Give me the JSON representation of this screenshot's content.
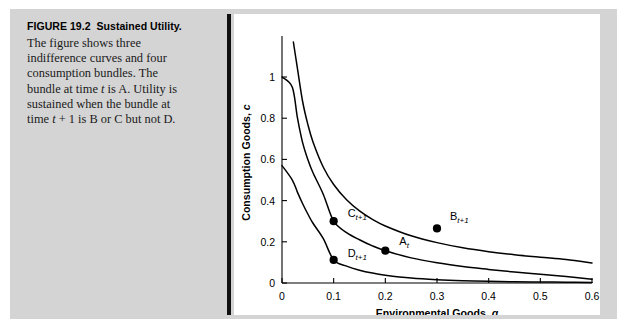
{
  "figure": {
    "label": "FIGURE 19.2",
    "title": "Sustained Utility.",
    "caption_lines": [
      "The figure shows three",
      "indifference curves and four",
      "consumption bundles. The",
      "bundle at time t is A. Utility is",
      "sustained when the bundle at",
      "time t + 1 is B or C but not D."
    ],
    "caption_full": "The figure shows three indifference curves and four consumption bundles. The bundle at time t is A. Utility is sustained when the bundle at time t + 1 is B or C but not D."
  },
  "colors": {
    "plate_background": "#d4d4d4",
    "panel_background": "#ffffff",
    "ink": "#000000",
    "divider": "#111111"
  },
  "chart_data": {
    "type": "line",
    "title": "",
    "xlabel": "Environmental Goods, g",
    "ylabel": "Consumption Goods, c",
    "xlim": [
      0,
      0.6
    ],
    "ylim": [
      0,
      1.17
    ],
    "grid": false,
    "legend": "none",
    "xticks": [
      0,
      0.1,
      0.2,
      0.3,
      0.4,
      0.5,
      0.6
    ],
    "xtick_labels": [
      "0",
      "0.1",
      "0.2",
      "0.3",
      "0.4",
      "0.5",
      "0.6"
    ],
    "yticks": [
      0,
      0.2,
      0.4,
      0.6,
      0.8,
      1
    ],
    "ytick_labels": [
      "0",
      "0.2",
      "0.4",
      "0.6",
      "0.8",
      "1"
    ],
    "series": [
      {
        "name": "upper indifference curve",
        "note": "highest utility; passes through B",
        "constant_k": 0.0795,
        "x": [
          0.022,
          0.03,
          0.04,
          0.05,
          0.06,
          0.08,
          0.1,
          0.125,
          0.15,
          0.175,
          0.2,
          0.25,
          0.3,
          0.35,
          0.4,
          0.45,
          0.5,
          0.55,
          0.6
        ],
        "y": [
          1.17,
          1.04,
          0.88,
          0.77,
          0.685,
          0.562,
          0.478,
          0.404,
          0.35,
          0.309,
          0.277,
          0.229,
          0.196,
          0.171,
          0.152,
          0.137,
          0.125,
          0.114,
          0.097
        ]
      },
      {
        "name": "middle indifference curve",
        "note": "passes through A and C",
        "constant_k": 0.0445,
        "x": [
          0.0,
          0.02,
          0.03,
          0.04,
          0.05,
          0.06,
          0.08,
          0.1,
          0.125,
          0.15,
          0.175,
          0.2,
          0.25,
          0.3,
          0.35,
          0.4,
          0.45,
          0.5,
          0.55,
          0.6
        ],
        "y": [
          1.0,
          0.95,
          0.8,
          0.68,
          0.6,
          0.535,
          0.43,
          0.3,
          0.245,
          0.21,
          0.18,
          0.157,
          0.122,
          0.098,
          0.08,
          0.066,
          0.053,
          0.042,
          0.031,
          0.018
        ]
      },
      {
        "name": "lower indifference curve",
        "note": "lowest utility; passes through D",
        "constant_k": 0.0168,
        "x": [
          0.0,
          0.02,
          0.03,
          0.04,
          0.05,
          0.06,
          0.08,
          0.1,
          0.125,
          0.15,
          0.175,
          0.2,
          0.25,
          0.3,
          0.35,
          0.4,
          0.45,
          0.5,
          0.55,
          0.6
        ],
        "y": [
          0.57,
          0.5,
          0.44,
          0.385,
          0.335,
          0.29,
          0.215,
          0.112,
          0.082,
          0.062,
          0.048,
          0.038,
          0.024,
          0.016,
          0.011,
          0.008,
          0.006,
          0.005,
          0.004,
          0.003
        ]
      }
    ],
    "points": [
      {
        "id": "C",
        "label_base": "C",
        "label_sub": "t+1",
        "x": 0.1,
        "y": 0.3,
        "label_dx": 14,
        "label_dy": -4
      },
      {
        "id": "A",
        "label_base": "A",
        "label_sub": "t",
        "x": 0.2,
        "y": 0.157,
        "label_dx": 14,
        "label_dy": -6
      },
      {
        "id": "B",
        "label_base": "B",
        "label_sub": "t+1",
        "x": 0.3,
        "y": 0.265,
        "label_dx": 13,
        "label_dy": -8
      },
      {
        "id": "D",
        "label_base": "D",
        "label_sub": "t+1",
        "x": 0.1,
        "y": 0.112,
        "label_dx": 14,
        "label_dy": -3
      }
    ]
  }
}
